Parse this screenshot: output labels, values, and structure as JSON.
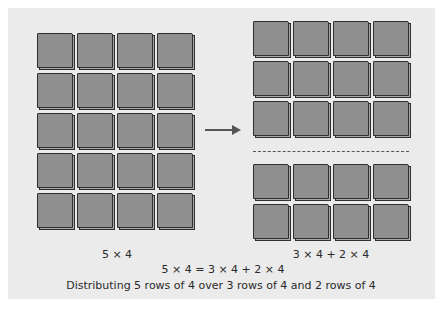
{
  "diagram": {
    "left_grid": {
      "rows": 5,
      "cols": 4,
      "label": "5 × 4"
    },
    "right_grid": {
      "top_group": {
        "rows": 3,
        "cols": 4
      },
      "bottom_group": {
        "rows": 2,
        "cols": 4
      },
      "label": "3 × 4 + 2 × 4"
    },
    "equation": "5 × 4 = 3 × 4 + 2 × 4",
    "caption": "Distributing 5 rows of 4 over 3 rows of 4 and 2 rows of 4",
    "colors": {
      "panel": "#ebebeb",
      "tile_face": "#8f8f8f",
      "tile_edge": "#2f2f2f",
      "arrow": "#555555"
    }
  }
}
